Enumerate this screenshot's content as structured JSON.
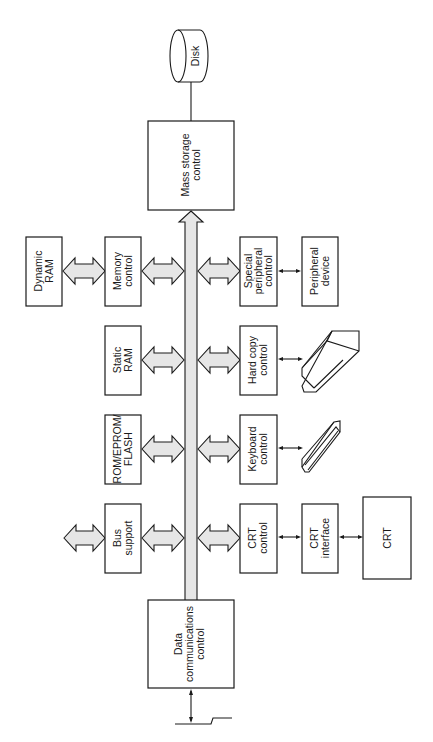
{
  "diagram": {
    "blocks": {
      "disk": {
        "label": "Disk"
      },
      "mass_storage": {
        "line1": "Mass storage",
        "line2": "control"
      },
      "dynamic_ram": {
        "line1": "Dynamic",
        "line2": "RAM"
      },
      "memory_control": {
        "line1": "Memory",
        "line2": "control"
      },
      "static_ram": {
        "line1": "Static",
        "line2": "RAM"
      },
      "rom": {
        "line1": "ROM/EPROM/",
        "line2": "FLASH"
      },
      "bus_support": {
        "line1": "Bus",
        "line2": "support"
      },
      "special_peripheral": {
        "line1": "Special",
        "line2": "peripheral",
        "line3": "control"
      },
      "peripheral_device": {
        "line1": "Peripheral",
        "line2": "device"
      },
      "hard_copy": {
        "line1": "Hard copy",
        "line2": "control"
      },
      "keyboard": {
        "line1": "Keyboard",
        "line2": "control"
      },
      "crt_control": {
        "line1": "CRT",
        "line2": "control"
      },
      "crt_interface": {
        "line1": "CRT",
        "line2": "interface"
      },
      "crt": {
        "label": "CRT"
      },
      "data_comm": {
        "line1": "Data",
        "line2": "communications",
        "line3": "control"
      }
    }
  }
}
